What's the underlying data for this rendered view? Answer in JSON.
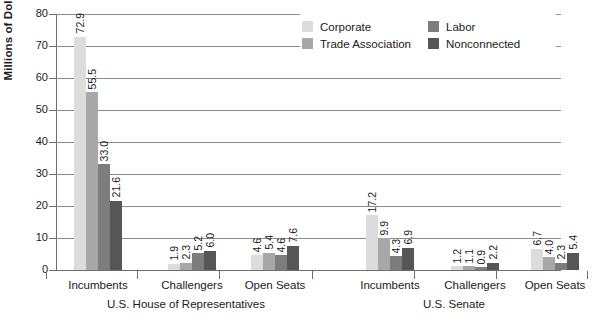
{
  "chart_data": {
    "type": "bar",
    "title": "",
    "xlabel": "",
    "ylabel": "Millions of Dollars",
    "ylim": [
      0,
      80
    ],
    "yticks": [
      "0",
      "10",
      "20",
      "30",
      "40",
      "50",
      "60",
      "70",
      "80"
    ],
    "grid": true,
    "legend_position": "top-right",
    "panels": [
      {
        "name": "U.S. House of Representatives",
        "categories": [
          "Incumbents",
          "Challengers",
          "Open Seats"
        ]
      },
      {
        "name": "U.S. Senate",
        "categories": [
          "Incumbents",
          "Challengers",
          "Open Seats"
        ]
      }
    ],
    "categories": [
      "House Incumbents",
      "House Challengers",
      "House Open Seats",
      "Senate Incumbents",
      "Senate Challengers",
      "Senate Open Seats"
    ],
    "series": [
      {
        "name": "Corporate",
        "color": "#dcdcdc",
        "values": [
          72.9,
          1.9,
          4.6,
          17.2,
          1.2,
          6.7
        ]
      },
      {
        "name": "Trade Association",
        "color": "#a8a8a8",
        "values": [
          55.5,
          2.3,
          5.4,
          9.9,
          1.1,
          4.0
        ]
      },
      {
        "name": "Labor",
        "color": "#7d7d7d",
        "values": [
          33.0,
          5.2,
          4.6,
          4.3,
          0.9,
          2.3
        ]
      },
      {
        "name": "Nonconnected",
        "color": "#565656",
        "values": [
          21.6,
          6.0,
          7.6,
          6.9,
          2.2,
          5.4
        ]
      }
    ],
    "value_labels": {
      "house_incumbents": [
        "72.9",
        "55.5",
        "33.0",
        "21.6"
      ],
      "house_challengers": [
        "1.9",
        "2.3",
        "5.2",
        "6.0"
      ],
      "house_open_seats": [
        "4.6",
        "5.4",
        "4.6",
        "7.6"
      ],
      "senate_incumbents": [
        "17.2",
        "9.9",
        "4.3",
        "6.9"
      ],
      "senate_challengers": [
        "1.2",
        "1.1",
        "0.9",
        "2.2"
      ],
      "senate_open_seats": [
        "6.7",
        "4.0",
        "2.3",
        "5.4"
      ]
    }
  },
  "legend": {
    "items": [
      {
        "label": "Corporate",
        "color": "#dcdcdc"
      },
      {
        "label": "Labor",
        "color": "#7d7d7d"
      },
      {
        "label": "Trade Association",
        "color": "#a8a8a8"
      },
      {
        "label": "Nonconnected",
        "color": "#565656"
      }
    ]
  },
  "axis": {
    "y_title": "Millions of Dollars"
  }
}
